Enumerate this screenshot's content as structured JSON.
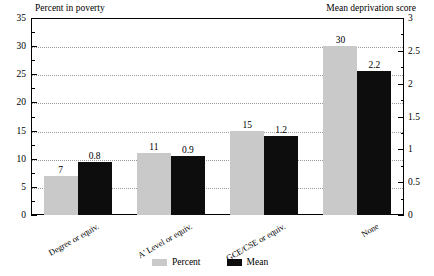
{
  "chart_data": {
    "type": "bar",
    "title": "",
    "categories": [
      "Degree or equiv.",
      "A' Level or equiv.",
      "GCE/CSE or equiv.",
      "None"
    ],
    "series": [
      {
        "name": "Percent",
        "axis": "left",
        "color": "#c9c9c9",
        "values": [
          7,
          11,
          15,
          30
        ],
        "labels": [
          "7",
          "11",
          "15",
          "30"
        ]
      },
      {
        "name": "Mean",
        "axis": "right",
        "color": "#0d0d0d",
        "values": [
          0.8,
          0.9,
          1.2,
          2.2
        ],
        "labels": [
          "0.8",
          "0.9",
          "1.2",
          "2.2"
        ]
      }
    ],
    "left_axis": {
      "label": "Percent in poverty",
      "ylim": [
        0,
        35
      ],
      "ticks": [
        0,
        5,
        10,
        15,
        20,
        25,
        30,
        35
      ],
      "tick_labels": [
        "0",
        "5",
        "10",
        "15",
        "20",
        "25",
        "30",
        "35"
      ],
      "minor_step": 2.5
    },
    "right_axis": {
      "label": "Mean deprivation score",
      "ylim": [
        0,
        3
      ],
      "ticks": [
        0,
        0.5,
        1,
        1.5,
        2,
        2.5,
        3
      ],
      "tick_labels": [
        "0",
        "0.5",
        "1",
        "1.5",
        "2",
        "2.5",
        "3"
      ],
      "minor_step": 0.25
    },
    "grid": true,
    "grid_style": "dotted",
    "legend": {
      "position": "bottom-center",
      "entries": [
        {
          "label": "Percent",
          "color": "#c9c9c9"
        },
        {
          "label": "Mean",
          "color": "#0d0d0d"
        }
      ]
    },
    "xlabel": "",
    "category_label_rotation": -30
  }
}
